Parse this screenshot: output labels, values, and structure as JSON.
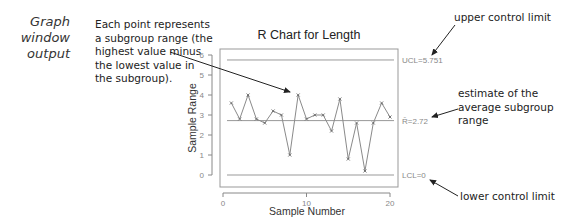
{
  "side_caption": "Graph window output",
  "annotations": {
    "point_note": "Each point represents a subgroup range (the highest value minus the lowest value in the subgroup).",
    "ucl_note": "upper control limit",
    "rbar_note": "estimate of the average subgroup range",
    "lcl_note": "lower control limit"
  },
  "chart_data": {
    "type": "line",
    "title": "R Chart for Length",
    "xlabel": "Sample Number",
    "ylabel": "Sample Range",
    "x": [
      1,
      2,
      3,
      4,
      5,
      6,
      7,
      8,
      9,
      10,
      11,
      12,
      13,
      14,
      15,
      16,
      17,
      18,
      19,
      20
    ],
    "values": [
      3.6,
      2.8,
      4.0,
      2.8,
      2.6,
      3.2,
      3.0,
      1.0,
      4.0,
      2.8,
      3.0,
      3.0,
      2.2,
      3.8,
      0.8,
      2.6,
      0.2,
      2.6,
      3.6,
      2.9
    ],
    "xlim": [
      0,
      20.5
    ],
    "ylim": [
      -0.6,
      6.3
    ],
    "xticks": [
      0,
      10,
      20
    ],
    "yticks": [
      0,
      1,
      2,
      3,
      4,
      5,
      6
    ],
    "grid": false,
    "control_limits": {
      "ucl": {
        "label": "UCL=5.751",
        "value": 5.751
      },
      "center": {
        "label": "R̄=2.72",
        "value": 2.72
      },
      "lcl": {
        "label": "LCL=0",
        "value": 0
      }
    },
    "colors": {
      "series": "#8a8a8a",
      "limits": "#999999",
      "axis": "#888888"
    }
  }
}
